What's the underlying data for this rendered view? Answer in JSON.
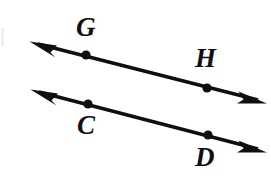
{
  "figure": {
    "background_color": "#ffffff",
    "stroke_color": "#100f0f",
    "labels": [
      {
        "text": "G",
        "x": 76,
        "y": 14
      },
      {
        "text": "H",
        "x": 195,
        "y": 45
      },
      {
        "text": "C",
        "x": 77,
        "y": 112
      },
      {
        "text": "D",
        "x": 195,
        "y": 144
      }
    ],
    "lines": [
      {
        "name": "line-GH",
        "from_x": 33,
        "from_y": 43,
        "to_x": 263,
        "to_y": 101,
        "arrow_start": true,
        "arrow_end": true,
        "points": [
          {
            "label": "G",
            "x": 86,
            "y": 55
          },
          {
            "label": "H",
            "x": 207,
            "y": 88
          }
        ]
      },
      {
        "name": "line-CD",
        "from_x": 34,
        "from_y": 91,
        "to_x": 263,
        "to_y": 150,
        "arrow_start": true,
        "arrow_end": true,
        "points": [
          {
            "label": "C",
            "x": 88,
            "y": 104
          },
          {
            "label": "D",
            "x": 208,
            "y": 135
          }
        ]
      }
    ]
  }
}
